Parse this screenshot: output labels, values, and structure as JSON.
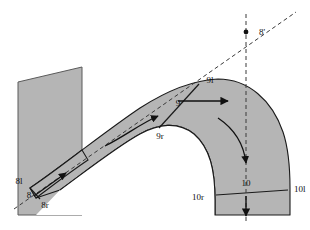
{
  "diagram": {
    "title": "",
    "background_color": "#ffffff",
    "fill_color": "#b5b5b5",
    "stroke_color": "#1a1a1a",
    "labels": {
      "eight_left": "8l",
      "eight": "8",
      "eight_right": "8r",
      "eight_prime": "8'",
      "nine_left": "9l",
      "nine": "9",
      "nine_right": "9r",
      "ten_left": "10l",
      "ten": "10",
      "ten_right": "10r"
    },
    "annotations": {
      "dot_marker": "●"
    }
  }
}
